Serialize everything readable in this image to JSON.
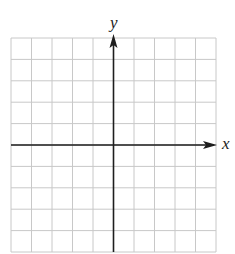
{
  "chart_data": {
    "type": "scatter",
    "title": "",
    "xlabel": "x",
    "ylabel": "y",
    "xlim": [
      -5,
      5
    ],
    "ylim": [
      -5,
      5
    ],
    "grid": true,
    "grid_divisions": {
      "x": 10,
      "y": 10
    },
    "tick_labels": {
      "x": [],
      "y": []
    },
    "series": [],
    "axes_arrows": {
      "positive_x": true,
      "positive_y": true
    },
    "colors": {
      "grid": "#c8c8c8",
      "axis": "#1e1e1e",
      "background": "#ffffff"
    }
  },
  "labels": {
    "x_axis": "x",
    "y_axis": "y"
  }
}
